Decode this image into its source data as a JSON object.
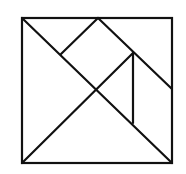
{
  "diagram": {
    "type": "tangram",
    "stroke_color": "#111111",
    "background": "#ffffff",
    "square": {
      "x": 22,
      "y": 18,
      "width": 150,
      "height": 145
    },
    "lines": [
      {
        "name": "main-diagonal",
        "x1": 22,
        "y1": 18,
        "x2": 172,
        "y2": 163
      },
      {
        "name": "anti-diagonal-half",
        "x1": 22,
        "y1": 163,
        "x2": 133,
        "y2": 53
      },
      {
        "name": "top-mid-to-right-mid",
        "x1": 98,
        "y1": 18,
        "x2": 172,
        "y2": 89
      },
      {
        "name": "top-mid-to-diagonal",
        "x1": 98,
        "y1": 18,
        "x2": 61,
        "y2": 54
      },
      {
        "name": "vertical-divider",
        "x1": 133,
        "y1": 53,
        "x2": 133,
        "y2": 123
      }
    ]
  }
}
